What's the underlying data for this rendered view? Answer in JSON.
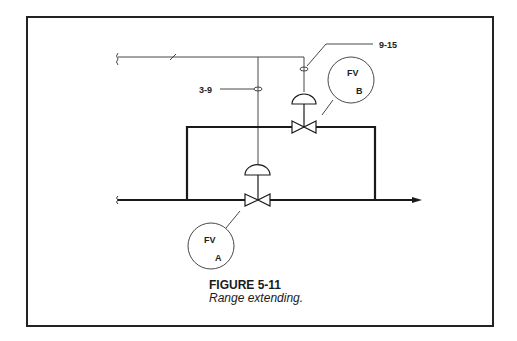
{
  "figure": {
    "number": "FIGURE 5-11",
    "title": "Range extending."
  },
  "signals": {
    "valve_a_range": "3-9",
    "valve_b_range": "9-15"
  },
  "valves": [
    {
      "id": "A",
      "tag": "FV",
      "letter": "A"
    },
    {
      "id": "B",
      "tag": "FV",
      "letter": "B"
    }
  ],
  "colors": {
    "line": "#1a1a1a",
    "frame": "#222222",
    "background": "#ffffff"
  }
}
